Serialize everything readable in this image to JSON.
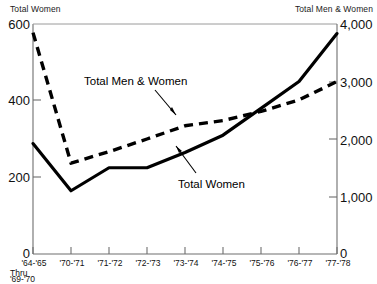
{
  "chart_data": {
    "type": "line",
    "title": "",
    "subtitle": "",
    "xlabel": "",
    "left_axis_title": "Total Women",
    "right_axis_title": "Total Men & Women",
    "categories": [
      "'64-'65",
      "'70-'71",
      "'71-'72",
      "'72-'73",
      "'73-'74",
      "'74-'75",
      "'75-'76",
      "'76-'77",
      "'77-'78"
    ],
    "x_first_tick_sub_lines": [
      "Thru",
      "'69-'70"
    ],
    "grid": false,
    "legend_position": "inline-annotations",
    "left_axis": {
      "label": "Total Women",
      "ticks": [
        0,
        200,
        400,
        600
      ],
      "tick_labels": [
        "0",
        "200",
        "400",
        "600"
      ],
      "ylim": [
        0,
        600
      ]
    },
    "right_axis": {
      "label": "Total Men & Women",
      "ticks": [
        0,
        1000,
        2000,
        3000,
        4000
      ],
      "tick_labels": [
        "0",
        "1,000",
        "2,000",
        "3,000",
        "4,000"
      ],
      "ylim": [
        0,
        4000
      ]
    },
    "series": [
      {
        "name": "Total Women",
        "axis": "left",
        "style": "solid",
        "color": "#000000",
        "values": [
          288,
          165,
          225,
          225,
          265,
          310,
          380,
          450,
          575
        ]
      },
      {
        "name": "Total Men & Women",
        "axis": "right",
        "style": "dashed",
        "color": "#000000",
        "values": [
          3850,
          1580,
          1780,
          2000,
          2230,
          2320,
          2480,
          2680,
          3000
        ]
      }
    ],
    "annotations": [
      {
        "text": "Total Men & Women",
        "target_series": "Total Men & Women"
      },
      {
        "text": "Total Women",
        "target_series": "Total Women"
      }
    ]
  }
}
